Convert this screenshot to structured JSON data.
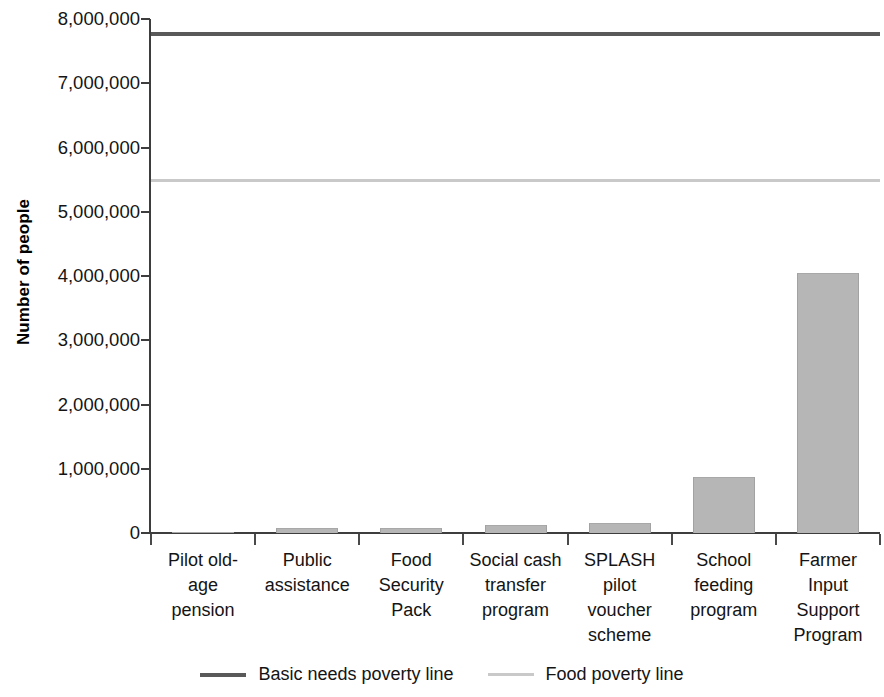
{
  "chart_data": {
    "type": "bar",
    "title": "",
    "xlabel": "",
    "ylabel": "Number of people",
    "ylim": [
      0,
      8000000
    ],
    "ytick_step": 1000000,
    "grid": false,
    "legend_position": "bottom",
    "categories": [
      "Pilot old-age pension",
      "Public assistance",
      "Food Security Pack",
      "Social cash transfer program",
      "SPLASH pilot voucher scheme",
      "School feeding program",
      "Farmer Input Support Program"
    ],
    "category_label_lines": [
      [
        "Pilot old-",
        "age",
        "pension"
      ],
      [
        "Public",
        "assistance"
      ],
      [
        "Food",
        "Security",
        "Pack"
      ],
      [
        "Social cash",
        "transfer",
        "program"
      ],
      [
        "SPLASH",
        "pilot",
        "voucher",
        "scheme"
      ],
      [
        "School",
        "feeding",
        "program"
      ],
      [
        "Farmer",
        "Input",
        "Support",
        "Program"
      ]
    ],
    "values": [
      8000,
      80000,
      80000,
      120000,
      150000,
      870000,
      4050000
    ],
    "ytick_labels": [
      "8,000,000",
      "7,000,000",
      "6,000,000",
      "5,000,000",
      "4,000,000",
      "3,000,000",
      "2,000,000",
      "1,000,000",
      "0"
    ],
    "ytick_values": [
      8000000,
      7000000,
      6000000,
      5000000,
      4000000,
      3000000,
      2000000,
      1000000,
      0
    ],
    "reference_lines": [
      {
        "name": "Basic needs poverty line",
        "value": 7770000,
        "color": "#595959"
      },
      {
        "name": "Food poverty line",
        "value": 5500000,
        "color": "#c9c9c9"
      }
    ],
    "bar_color": "#b6b6b6"
  },
  "legend": {
    "items": [
      {
        "label": "Basic needs poverty line"
      },
      {
        "label": "Food poverty line"
      }
    ]
  }
}
